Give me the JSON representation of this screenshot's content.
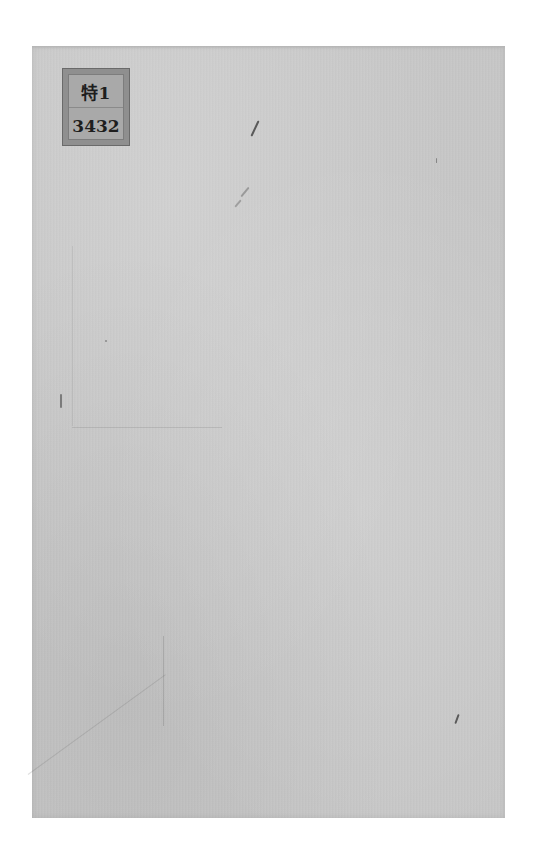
{
  "document": {
    "type": "scanned book cover",
    "colors": {
      "background": "#ffffff",
      "paper": "#c9c9c9",
      "label_outer": "#8f8f8f",
      "label_inner": "#a9a9a9",
      "label_text": "#1e1e1e"
    }
  },
  "label": {
    "top_text": "特1",
    "bottom_text": "3432"
  }
}
